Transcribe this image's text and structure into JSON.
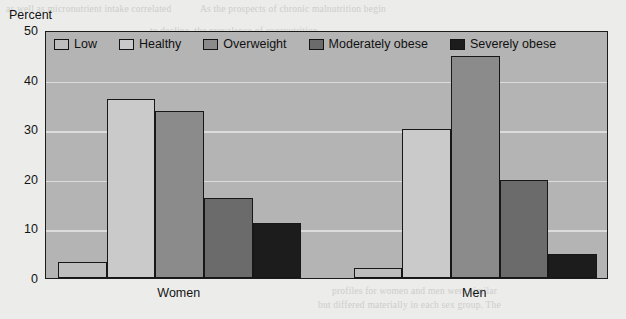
{
  "chart_data": {
    "type": "bar",
    "title": "",
    "subtitle": "",
    "xlabel": "",
    "ylabel": "Percent",
    "ylim": [
      0,
      50
    ],
    "ytick_values": [
      50,
      40,
      30,
      20,
      10,
      0
    ],
    "ytick_labels": [
      "50",
      "40",
      "30",
      "20",
      "10",
      "0"
    ],
    "grid": true,
    "grid_axis": "y",
    "legend_position": "top-left-inside",
    "categories": [
      "Women",
      "Men"
    ],
    "series": [
      {
        "name": "Low",
        "values": [
          3.3,
          2.0
        ],
        "color": "#bebebe"
      },
      {
        "name": "Healthy",
        "values": [
          36.0,
          30.0
        ],
        "color": "#cacaca"
      },
      {
        "name": "Overweight",
        "values": [
          33.6,
          44.7
        ],
        "color": "#8b8b8b"
      },
      {
        "name": "Moderately obese",
        "values": [
          16.1,
          19.8
        ],
        "color": "#6b6b6b"
      },
      {
        "name": "Severely obese",
        "values": [
          11.1,
          4.8
        ],
        "color": "#1c1c1c"
      }
    ]
  },
  "axis": {
    "y_title": "Percent"
  },
  "page_bleed": {
    "lines": [
      {
        "text": "as well as micronutrient intake correlated",
        "x": 6,
        "y": 4
      },
      {
        "text": "As the prospects of chronic malnutrition begin",
        "x": 200,
        "y": 4
      },
      {
        "text": "to decline, the prevalence of overnutrition",
        "x": 150,
        "y": 26
      },
      {
        "text": "that the global burden of chronic disease",
        "x": 118,
        "y": 74
      },
      {
        "text": "in adults. This suggests that, in many countries",
        "x": 140,
        "y": 96
      },
      {
        "text": "the double burden of malnutrition now",
        "x": 150,
        "y": 118
      },
      {
        "text": "represents a significant public health concern",
        "x": 136,
        "y": 140
      },
      {
        "text": "across a wide range of income settings",
        "x": 160,
        "y": 162
      },
      {
        "text": "and that the epidemiological transition",
        "x": 180,
        "y": 184
      },
      {
        "text": "is progressing at an accelerating pace",
        "x": 214,
        "y": 206
      },
      {
        "text": "profiles for women and men were similar",
        "x": 332,
        "y": 286
      },
      {
        "text": "but differed materially in each sex group. The",
        "x": 318,
        "y": 300
      }
    ]
  }
}
